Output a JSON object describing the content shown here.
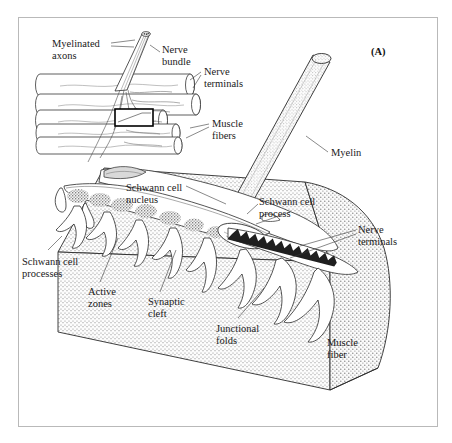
{
  "figure": {
    "panel_label": "(A)",
    "type": "anatomical-diagram",
    "border_color": "#b9b9b9",
    "ink_color": "#1a1a1a",
    "stipple_color": "#8a8a8a"
  },
  "inset": {
    "name": "nerve-bundle-overview",
    "muscle_fiber_count": 5,
    "labels": [
      {
        "id": "myelinated-axons",
        "text": "Myelinated\naxons",
        "x": 52,
        "y": 38
      },
      {
        "id": "nerve-bundle",
        "text": "Nerve\nbundle",
        "x": 162,
        "y": 44
      },
      {
        "id": "nerve-terminals",
        "text": "Nerve\nterminals",
        "x": 204,
        "y": 66
      },
      {
        "id": "muscle-fibers",
        "text": "Muscle\nfibers",
        "x": 212,
        "y": 118
      }
    ],
    "highlight_box": {
      "x": 115,
      "y": 109,
      "w": 38,
      "h": 17
    }
  },
  "main": {
    "name": "expanded-junction-view",
    "labels": [
      {
        "id": "myelin",
        "text": "Myelin",
        "x": 331,
        "y": 147
      },
      {
        "id": "schwann-cell-nucleus",
        "text": "Schwann cell\nnucleus",
        "x": 126,
        "y": 182
      },
      {
        "id": "schwann-cell-process",
        "text": "Schwann cell\nprocess",
        "x": 259,
        "y": 196
      },
      {
        "id": "nerve-terminals-main",
        "text": "Nerve\nterminals",
        "x": 358,
        "y": 224
      },
      {
        "id": "schwann-cell-processes",
        "text": "Schwann cell\nprocesses",
        "x": 22,
        "y": 256
      },
      {
        "id": "active-zones",
        "text": "Active\nzones",
        "x": 88,
        "y": 286
      },
      {
        "id": "synaptic-cleft",
        "text": "Synaptic\ncleft",
        "x": 148,
        "y": 296
      },
      {
        "id": "junctional-folds",
        "text": "Junctional\nfolds",
        "x": 216,
        "y": 323
      },
      {
        "id": "muscle-fiber",
        "text": "Muscle\nfiber",
        "x": 327,
        "y": 337
      }
    ]
  }
}
